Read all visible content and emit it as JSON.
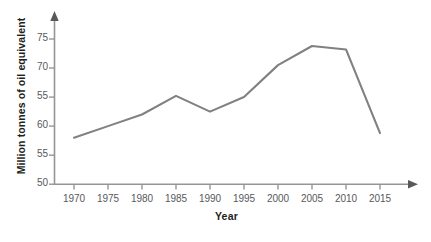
{
  "chart_data": {
    "type": "line",
    "title": "",
    "xlabel": "Year",
    "ylabel": "Million tonnes of oil equivalent",
    "x": [
      1970,
      1975,
      1980,
      1985,
      1990,
      1995,
      2000,
      2005,
      2010,
      2015
    ],
    "categories": [
      "1970",
      "1975",
      "1980",
      "1985",
      "1990",
      "1995",
      "2000",
      "2005",
      "2010",
      "2015"
    ],
    "values": [
      58.0,
      60.0,
      62.0,
      65.2,
      62.5,
      65.0,
      70.5,
      73.8,
      73.2,
      58.8
    ],
    "series": [
      {
        "name": "Energy consumption",
        "values": [
          58.0,
          60.0,
          62.0,
          65.2,
          62.5,
          65.0,
          70.5,
          73.8,
          73.2,
          58.8
        ]
      }
    ],
    "xlim": [
      1970,
      2015
    ],
    "ylim": [
      50,
      75
    ],
    "xtick_labels": [
      "1970",
      "1975",
      "1980",
      "1985",
      "1990",
      "1995",
      "2000",
      "2005",
      "2010",
      "2015"
    ],
    "ytick_values": [
      50,
      55,
      60,
      65,
      70,
      75
    ],
    "ytick_labels": [
      "50",
      "55",
      "60",
      "55",
      "70",
      "75"
    ],
    "grid": false,
    "legend": "none",
    "line_color": "#808184",
    "axis_color": "#939598",
    "text_color": "#58595b",
    "axis_title_color": "#231f20",
    "background": "#ffffff",
    "markers": false,
    "annotations": []
  },
  "caption": {
    "text": ""
  }
}
